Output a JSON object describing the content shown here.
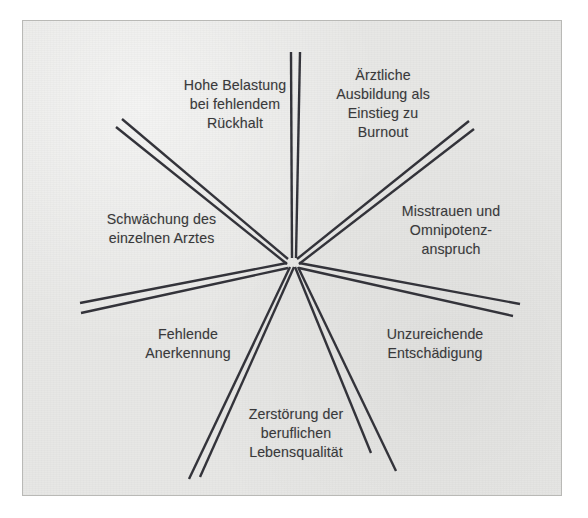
{
  "figure": {
    "type": "radial-star-diagram",
    "background_color": "#e7e7e5",
    "line_color": "#33333a",
    "text_color": "#39393b",
    "border_color": "#b9b9b6",
    "center": {
      "x": 293,
      "y": 263
    },
    "ray_count": 7
  },
  "labels": [
    {
      "id": "hohe-belastung",
      "text": "Hohe Belastung\nbei fehlendem\nRückhalt",
      "x": 160,
      "y": 76,
      "width": 150
    },
    {
      "id": "aerztliche-ausbildung",
      "text": "Ärztliche\nAusbildung als\nEinstieg zu\nBurnout",
      "x": 318,
      "y": 66,
      "width": 130
    },
    {
      "id": "schwaechung",
      "text": "Schwächung des\neinzelnen Arztes",
      "x": 84,
      "y": 210,
      "width": 155
    },
    {
      "id": "misstrauen",
      "text": "Misstrauen und\nOmnipotenz-\nanspruch",
      "x": 376,
      "y": 202,
      "width": 150
    },
    {
      "id": "fehlende-anerkennung",
      "text": "Fehlende\nAnerkennung",
      "x": 118,
      "y": 325,
      "width": 140
    },
    {
      "id": "unzureichende-entschaedigung",
      "text": "Unzureichende\nEntschädigung",
      "x": 360,
      "y": 325,
      "width": 150
    },
    {
      "id": "zerstoerung",
      "text": "Zerstörung der\nberuflichen\nLebensqualität",
      "x": 222,
      "y": 405,
      "width": 148
    }
  ],
  "rays": [
    {
      "id": "ray-up",
      "direction": "up",
      "a": {
        "x1": 291,
        "y1": 52,
        "x2": 292,
        "y2": 258
      },
      "b": {
        "x1": 300,
        "y1": 52,
        "x2": 296,
        "y2": 258
      }
    },
    {
      "id": "ray-upper-left",
      "direction": "upper-left",
      "a": {
        "x1": 122,
        "y1": 119,
        "x2": 288,
        "y2": 259
      },
      "b": {
        "x1": 116,
        "y1": 127,
        "x2": 287,
        "y2": 264
      }
    },
    {
      "id": "ray-upper-right",
      "direction": "upper-right",
      "a": {
        "x1": 469,
        "y1": 121,
        "x2": 297,
        "y2": 259
      },
      "b": {
        "x1": 474,
        "y1": 129,
        "x2": 299,
        "y2": 264
      }
    },
    {
      "id": "ray-left",
      "direction": "left",
      "a": {
        "x1": 80,
        "y1": 303,
        "x2": 287,
        "y2": 263
      },
      "b": {
        "x1": 81,
        "y1": 313,
        "x2": 288,
        "y2": 268
      }
    },
    {
      "id": "ray-right",
      "direction": "right",
      "a": {
        "x1": 520,
        "y1": 304,
        "x2": 299,
        "y2": 263
      },
      "b": {
        "x1": 513,
        "y1": 316,
        "x2": 299,
        "y2": 268
      }
    },
    {
      "id": "ray-lower-left",
      "direction": "lower-left",
      "a": {
        "x1": 189,
        "y1": 479,
        "x2": 290,
        "y2": 267
      },
      "b": {
        "x1": 200,
        "y1": 477,
        "x2": 294,
        "y2": 267
      }
    },
    {
      "id": "ray-lower-right",
      "direction": "lower-right",
      "a": {
        "x1": 371,
        "y1": 453,
        "x2": 295,
        "y2": 267
      },
      "b": {
        "x1": 396,
        "y1": 471,
        "x2": 298,
        "y2": 267
      }
    }
  ]
}
